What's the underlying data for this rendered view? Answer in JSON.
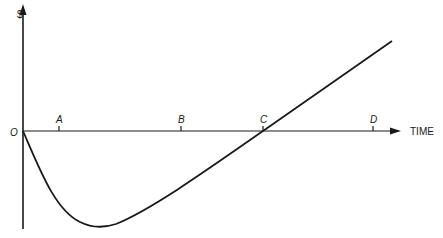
{
  "diagram": {
    "y_axis_label": "$",
    "x_axis_label": "TIME",
    "origin_label": "O",
    "ticks": [
      {
        "label": "A",
        "x": 59
      },
      {
        "label": "B",
        "x": 181
      },
      {
        "label": "C",
        "x": 263
      },
      {
        "label": "D",
        "x": 373
      }
    ],
    "curve_description": "Cash position dips below zero after O, reaches minimum between A and B, rises linearly, crosses zero at C and keeps increasing past D",
    "colors": {
      "ink": "#1a1a1a",
      "background": "#ffffff"
    }
  }
}
